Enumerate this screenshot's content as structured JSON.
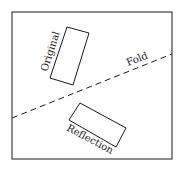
{
  "diagram": {
    "labels": {
      "original": "Original",
      "fold": "Fold",
      "reflection": "Reflection"
    },
    "colors": {
      "stroke": "#1a1a1a",
      "background": "#ffffff"
    },
    "frame": {
      "x": 12,
      "y": 12,
      "width": 160,
      "height": 147
    },
    "fold_line": {
      "x1": 12,
      "y1": 118,
      "x2": 172,
      "y2": 54,
      "style": "dashed"
    },
    "original_rect": {
      "points": "67,27 89,33 73,85 50,78"
    },
    "reflection_rect": {
      "points": "80,103 126,128 116,147 69,120"
    }
  }
}
